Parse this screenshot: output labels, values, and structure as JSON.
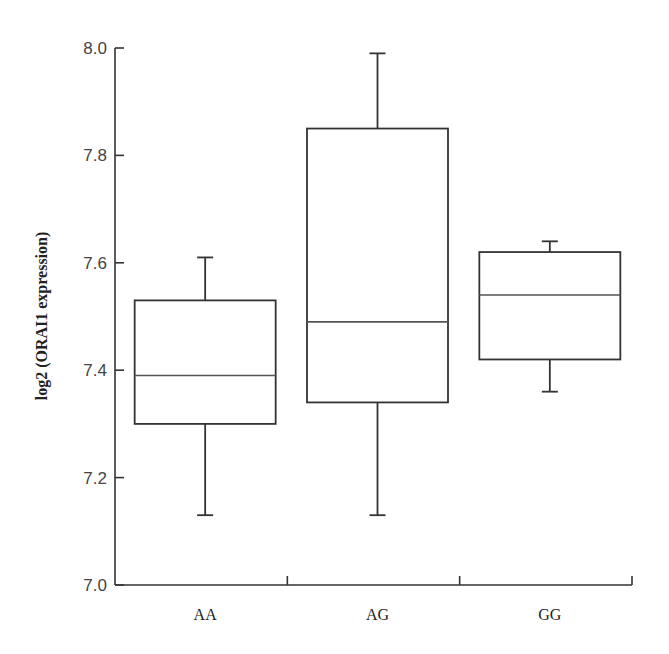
{
  "chart_data": {
    "type": "box",
    "title": "",
    "xlabel": "",
    "ylabel": "log2 (ORAI1 expression)",
    "ylim": [
      7.0,
      8.0
    ],
    "yticks": [
      "7.0",
      "7.2",
      "7.4",
      "7.6",
      "7.8",
      "8.0"
    ],
    "categories": [
      "AA",
      "AG",
      "GG"
    ],
    "boxes": [
      {
        "category": "AA",
        "whisker_low": 7.13,
        "q1": 7.3,
        "median": 7.39,
        "q3": 7.53,
        "whisker_high": 7.61
      },
      {
        "category": "AG",
        "whisker_low": 7.13,
        "q1": 7.34,
        "median": 7.49,
        "q3": 7.85,
        "whisker_high": 7.99
      },
      {
        "category": "GG",
        "whisker_low": 7.36,
        "q1": 7.42,
        "median": 7.54,
        "q3": 7.62,
        "whisker_high": 7.64
      }
    ],
    "grid": false,
    "legend": null
  },
  "colors": {
    "axis": "#333333",
    "box_stroke": "#333333",
    "median": "#555555",
    "background": "#ffffff"
  }
}
